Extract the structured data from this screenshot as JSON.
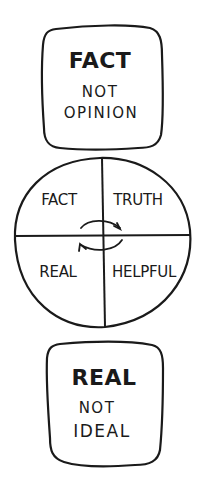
{
  "top_card": {
    "title": "FACT",
    "line1": "NOT",
    "line2": "OPINION"
  },
  "circle": {
    "quadrants": [
      {
        "position": "top-left",
        "label": "FACT"
      },
      {
        "position": "top-right",
        "label": "TRUTH"
      },
      {
        "position": "bottom-left",
        "label": "REAL"
      },
      {
        "position": "bottom-right",
        "label": "HELPFUL"
      }
    ],
    "center_icon": "cycle-arrows-icon"
  },
  "bottom_card": {
    "title": "REAL",
    "line1": "NOT",
    "line2": "IDEAL"
  },
  "colors": {
    "ink": "#1a1a1a",
    "background": "#ffffff"
  }
}
